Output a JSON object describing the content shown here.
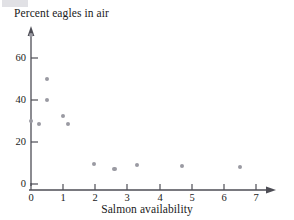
{
  "chart_data": {
    "type": "scatter",
    "title": "Percent eagles in air",
    "xlabel": "Salmon availability",
    "ylabel": "Percent eagles in air",
    "xlim": [
      0,
      7.6
    ],
    "ylim": [
      0,
      76
    ],
    "grid": false,
    "legend": null,
    "xticks": [
      0,
      1,
      2,
      3,
      4,
      5,
      6,
      7
    ],
    "yticks": [
      0,
      20,
      40,
      60
    ],
    "xtick_labels": [
      "0",
      "1",
      "2",
      "3",
      "4",
      "5",
      "6",
      "7"
    ],
    "ytick_labels": [
      "0",
      "20",
      "40",
      "60"
    ],
    "marker_color": "#9a9aa2",
    "axis_color": "#4d4d55",
    "points": [
      {
        "x": 0.0,
        "y": 71.0
      },
      {
        "x": 0.0,
        "y": 30.0
      },
      {
        "x": 0.25,
        "y": 28.5
      },
      {
        "x": 0.5,
        "y": 50.0
      },
      {
        "x": 0.5,
        "y": 40.0
      },
      {
        "x": 1.0,
        "y": 32.5
      },
      {
        "x": 1.15,
        "y": 28.5
      },
      {
        "x": 1.95,
        "y": 9.5
      },
      {
        "x": 2.6,
        "y": 7.0
      },
      {
        "x": 3.3,
        "y": 9.0
      },
      {
        "x": 4.7,
        "y": 8.5
      },
      {
        "x": 6.5,
        "y": 8.0
      }
    ]
  }
}
